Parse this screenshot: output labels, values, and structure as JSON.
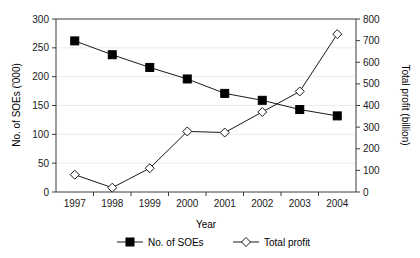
{
  "chart_data": {
    "type": "line",
    "title": "",
    "subtitle": "",
    "xlabel": "Year",
    "categories": [
      "1997",
      "1998",
      "1999",
      "2000",
      "2001",
      "2002",
      "2003",
      "2004"
    ],
    "x": [
      1997,
      1998,
      1999,
      2000,
      2001,
      2002,
      2003,
      2004
    ],
    "grid": true,
    "legend_position": "bottom",
    "axes": {
      "x": {
        "label": "Year",
        "ticks": [
          "1997",
          "1998",
          "1999",
          "2000",
          "2001",
          "2002",
          "2003",
          "2004"
        ],
        "range": [
          1997,
          2004
        ]
      },
      "y_left": {
        "label": "No. of SOEs ('000)",
        "ticks": [
          "0",
          "50",
          "100",
          "150",
          "200",
          "250",
          "300"
        ],
        "tick_values": [
          0,
          50,
          100,
          150,
          200,
          250,
          300
        ],
        "ylim": [
          0,
          300
        ]
      },
      "y_right": {
        "label": "Total profit (billion)",
        "ticks": [
          "0",
          "100",
          "200",
          "300",
          "400",
          "500",
          "600",
          "700",
          "800"
        ],
        "tick_values": [
          0,
          100,
          200,
          300,
          400,
          500,
          600,
          700,
          800
        ],
        "ylim": [
          0,
          800
        ]
      }
    },
    "series": [
      {
        "name": "No. of SOEs",
        "axis": "left",
        "marker": "filled-square",
        "color": "#000000",
        "values": [
          262,
          238,
          216,
          196,
          171,
          159,
          143,
          132
        ]
      },
      {
        "name": "Total profit",
        "axis": "right",
        "marker": "open-diamond",
        "color": "#1a1a1a",
        "values": [
          80,
          20,
          110,
          280,
          275,
          370,
          465,
          730
        ]
      }
    ]
  },
  "legend": {
    "items": [
      {
        "label": "No. of SOEs",
        "marker": "filled-square"
      },
      {
        "label": "Total profit",
        "marker": "open-diamond"
      }
    ]
  },
  "colors": {
    "axis": "#3a3a3a",
    "grid": "#ebebeb",
    "series_soes": "#000000",
    "series_profit": "#1a1a1a",
    "background": "#ffffff"
  }
}
